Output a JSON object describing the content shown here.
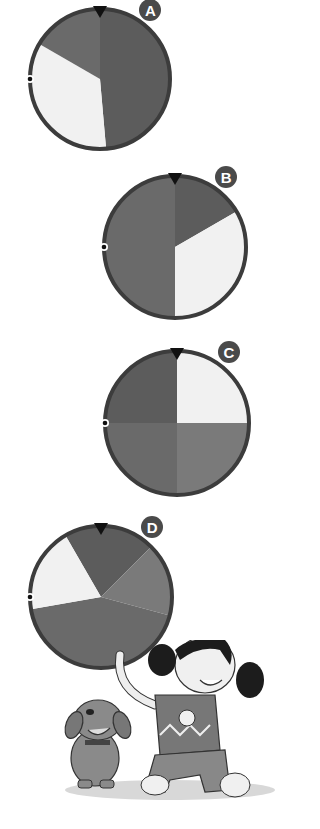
{
  "colors": {
    "dark": "#5c5c5c",
    "medium": "#6a6a6a",
    "light_gray": "#7a7a7a",
    "white": "#f1f1f1",
    "border": "#3c3c3c",
    "label_bg": "#4a4a4a"
  },
  "spinners": [
    {
      "label": "A",
      "cx": 100,
      "cy": 79,
      "r": 70,
      "sectors": [
        {
          "start": 0,
          "end": 175,
          "color": "dark"
        },
        {
          "start": 175,
          "end": 300,
          "color": "white"
        },
        {
          "start": 300,
          "end": 360,
          "color": "medium"
        }
      ]
    },
    {
      "label": "B",
      "cx": 175,
      "cy": 247,
      "r": 71,
      "sectors": [
        {
          "start": 0,
          "end": 60,
          "color": "dark"
        },
        {
          "start": 60,
          "end": 180,
          "color": "white"
        },
        {
          "start": 180,
          "end": 360,
          "color": "medium"
        }
      ]
    },
    {
      "label": "C",
      "cx": 177,
      "cy": 423,
      "r": 72,
      "sectors": [
        {
          "start": 0,
          "end": 90,
          "color": "white"
        },
        {
          "start": 90,
          "end": 180,
          "color": "light_gray"
        },
        {
          "start": 180,
          "end": 270,
          "color": "medium"
        },
        {
          "start": 270,
          "end": 360,
          "color": "dark"
        }
      ]
    },
    {
      "label": "D",
      "cx": 101,
      "cy": 597,
      "r": 71,
      "sectors": [
        {
          "start": 330,
          "end": 405,
          "color": "dark"
        },
        {
          "start": 45,
          "end": 105,
          "color": "light_gray"
        },
        {
          "start": 105,
          "end": 260,
          "color": "medium"
        },
        {
          "start": 260,
          "end": 330,
          "color": "white"
        }
      ]
    }
  ],
  "illustration": {
    "subject": "girl-and-dog"
  }
}
